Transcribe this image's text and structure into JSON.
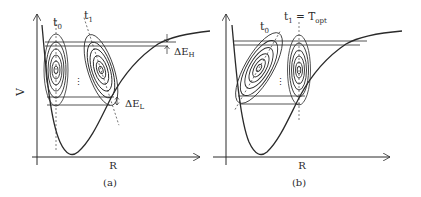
{
  "panels": [
    {
      "id": "a",
      "caption": "(a)",
      "x_axis_label": "R",
      "y_axis_label": "V",
      "wavepacket_labels": {
        "t0": "t",
        "t0_sub": "0",
        "t1": "t",
        "t1_sub": "1"
      },
      "energy_spread_high": {
        "delta": "ΔE",
        "sub": "H"
      },
      "energy_spread_low": {
        "delta": "ΔE",
        "sub": "L"
      },
      "ellipsis": "⋮"
    },
    {
      "id": "b",
      "caption": "(b)",
      "x_axis_label": "R",
      "wavepacket_labels": {
        "t0": "t",
        "t0_sub": "0",
        "t1": "t",
        "t1_sub": "1",
        "t1_eq": " = T",
        "t1_eq_sub": "opt"
      },
      "ellipsis": "⋮"
    }
  ],
  "colors": {
    "ink": "#2a2a2a",
    "background": "#ffffff"
  }
}
